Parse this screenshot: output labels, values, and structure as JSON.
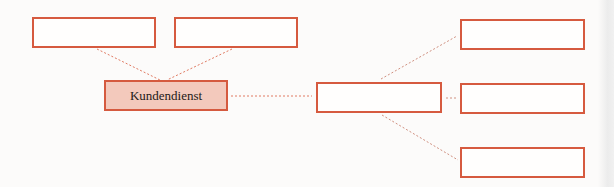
{
  "diagram": {
    "type": "mind-map",
    "colors": {
      "border": "#d65a3f",
      "center_fill": "#f3c9bc",
      "connector": "#e07a62",
      "background": "#fcfbfa"
    },
    "nodes": [
      {
        "id": "left-top-1",
        "label": "",
        "x": 32,
        "y": 17,
        "w": 124,
        "h": 31
      },
      {
        "id": "left-top-2",
        "label": "",
        "x": 174,
        "y": 17,
        "w": 124,
        "h": 31
      },
      {
        "id": "center",
        "label": "Kundendienst",
        "x": 104,
        "y": 80,
        "w": 124,
        "h": 31,
        "filled": true
      },
      {
        "id": "hub",
        "label": "",
        "x": 316,
        "y": 82,
        "w": 126,
        "h": 31
      },
      {
        "id": "right-1",
        "label": "",
        "x": 460,
        "y": 19,
        "w": 125,
        "h": 31
      },
      {
        "id": "right-2",
        "label": "",
        "x": 460,
        "y": 83,
        "w": 125,
        "h": 31
      },
      {
        "id": "right-3",
        "label": "",
        "x": 460,
        "y": 147,
        "w": 125,
        "h": 31
      }
    ],
    "edges": [
      {
        "from": "left-top-1",
        "to": "center",
        "x1": 97,
        "y1": 49,
        "x2": 160,
        "y2": 80
      },
      {
        "from": "left-top-2",
        "to": "center",
        "x1": 232,
        "y1": 49,
        "x2": 167,
        "y2": 80
      },
      {
        "from": "center",
        "to": "hub",
        "x1": 231,
        "y1": 96,
        "x2": 312,
        "y2": 96
      },
      {
        "from": "hub",
        "to": "right-1",
        "x1": 381,
        "y1": 79,
        "x2": 457,
        "y2": 36
      },
      {
        "from": "hub",
        "to": "right-2",
        "x1": 446,
        "y1": 98,
        "x2": 456,
        "y2": 98
      },
      {
        "from": "hub",
        "to": "right-3",
        "x1": 382,
        "y1": 115,
        "x2": 458,
        "y2": 160
      }
    ]
  }
}
